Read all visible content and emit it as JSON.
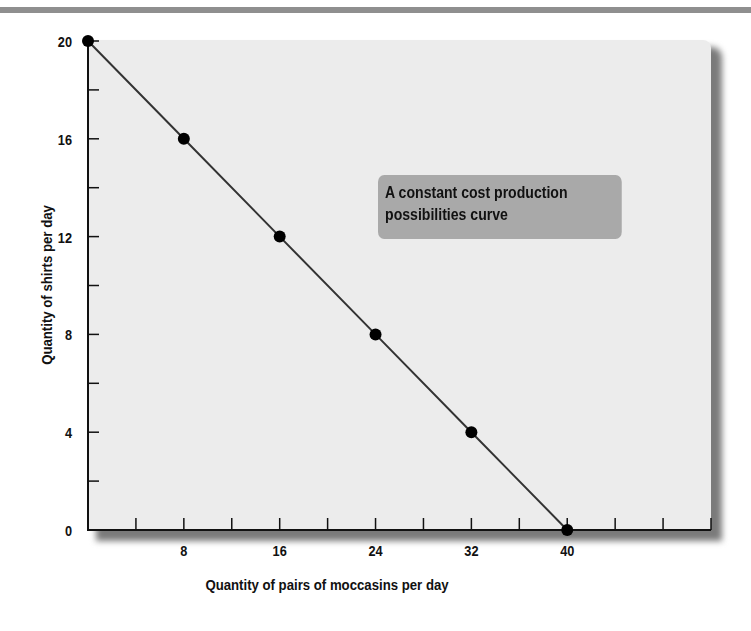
{
  "chart_data": {
    "type": "line",
    "title": "",
    "annotation": "A constant cost production possibilities curve",
    "xlabel": "Quantity of pairs of moccasins per day",
    "ylabel": "Quantity of shirts per day",
    "x": [
      0,
      8,
      16,
      24,
      32,
      40
    ],
    "series": [
      {
        "name": "Production possibilities curve",
        "values": [
          20,
          16,
          12,
          8,
          4,
          0
        ]
      }
    ],
    "x_tick_labels": [
      "8",
      "16",
      "24",
      "32",
      "40"
    ],
    "y_tick_labels": [
      "0",
      "4",
      "8",
      "12",
      "16",
      "20"
    ],
    "xlim": [
      0,
      52
    ],
    "ylim": [
      0,
      20
    ],
    "grid": false,
    "legend": "none",
    "colors": {
      "plot_background": "#ececec",
      "line": "#333333",
      "marker": "#000000",
      "annotation_box": "#a9a9a9"
    }
  }
}
